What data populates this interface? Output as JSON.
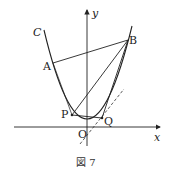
{
  "figure": {
    "caption": "図 7",
    "axes": {
      "x_label": "x",
      "y_label": "y",
      "origin_label": "O"
    },
    "curve_label": "C",
    "points": [
      {
        "name": "A",
        "label": "A"
      },
      {
        "name": "B",
        "label": "B"
      },
      {
        "name": "P",
        "label": "P"
      },
      {
        "name": "Q",
        "label": "Q"
      }
    ],
    "segments": [
      "AB",
      "BP",
      "BQ",
      "PQ",
      "AP"
    ],
    "tangent_line": "dashed line through Q",
    "colors": {
      "stroke": "#222222",
      "background": "#ffffff"
    }
  }
}
